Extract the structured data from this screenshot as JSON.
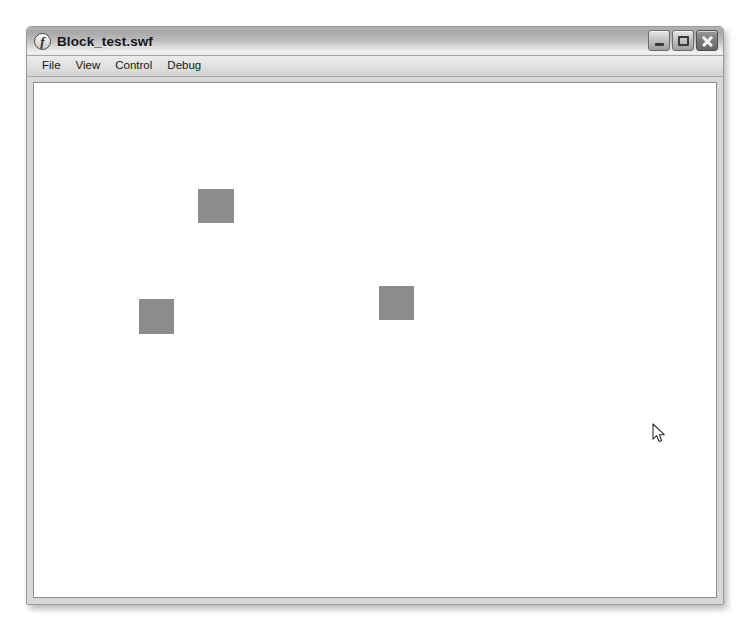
{
  "window": {
    "title": "Block_test.swf",
    "app_icon": "flash-player-icon",
    "controls": [
      {
        "name": "minimize",
        "label": "Minimize",
        "glyph": "minimize-icon"
      },
      {
        "name": "maximize",
        "label": "Maximize",
        "glyph": "maximize-icon"
      },
      {
        "name": "close",
        "label": "Close",
        "glyph": "close-icon"
      }
    ]
  },
  "menu": {
    "items": [
      {
        "label": "File"
      },
      {
        "label": "View"
      },
      {
        "label": "Control"
      },
      {
        "label": "Debug"
      }
    ]
  },
  "stage": {
    "background_color": "#ffffff",
    "block_color": "#8c8c8c",
    "blocks": [
      {
        "name": "block-top",
        "x": 164,
        "y": 106,
        "width": 36,
        "height": 34
      },
      {
        "name": "block-left",
        "x": 105,
        "y": 216,
        "width": 35,
        "height": 35
      },
      {
        "name": "block-right",
        "x": 345,
        "y": 203,
        "width": 35,
        "height": 34
      }
    ]
  },
  "cursor": {
    "name": "arrow-cursor",
    "x": 651,
    "y": 422
  }
}
